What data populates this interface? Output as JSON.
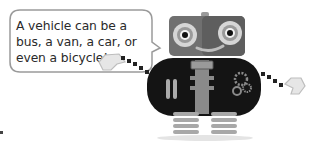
{
  "speech_bubble": {
    "lines": [
      "A vehicle can be a",
      "bus, a van, a car, or",
      "even a bicycle!"
    ]
  },
  "illustration": {
    "character": "robot-icon",
    "colors": {
      "head": "#6e6e6e",
      "eye_ring": "#c8c8c8",
      "body": "#141414",
      "spine": "#9a9a9a",
      "legs": "#a8a8a8",
      "bubble_border": "#9a9a9a"
    }
  }
}
